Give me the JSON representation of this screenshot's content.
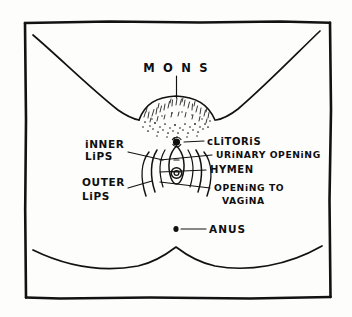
{
  "diagram": {
    "style": "hand-drawn ink line illustration",
    "background_color": "#fdfdfc",
    "ink_color": "#121212",
    "frame": {
      "name": "hand-drawn rectangular border",
      "shown": true
    },
    "labels": {
      "mons": "M O N S",
      "inner_lips_line1": "iNNER",
      "inner_lips_line2": "LiPS",
      "outer_lips_line1": "OUTER",
      "outer_lips_line2": "LiPS",
      "clitoris": "cLiTORiS",
      "urinary_opening": "URiNARY OPENiNG",
      "hymen": "HYMEN",
      "opening_to_vagina_line1": "OPENiNG TO",
      "opening_to_vagina_line2": "VAGiNA",
      "anus": "ANUS"
    },
    "parts": [
      {
        "id": "mons",
        "label": "M O N S",
        "side": "top",
        "leader": "vertical"
      },
      {
        "id": "inner-lips",
        "label": "iNNER LiPS",
        "side": "left",
        "leader": "diagonal"
      },
      {
        "id": "outer-lips",
        "label": "OUTER LiPS",
        "side": "left",
        "leader": "diagonal"
      },
      {
        "id": "clitoris",
        "label": "cLiTORiS",
        "side": "right",
        "leader": "horizontal"
      },
      {
        "id": "urinary-opening",
        "label": "URiNARY OPENiNG",
        "side": "right",
        "leader": "diagonal"
      },
      {
        "id": "hymen",
        "label": "HYMEN",
        "side": "right",
        "leader": "horizontal"
      },
      {
        "id": "opening-to-vagina",
        "label": "OPENiNG TO VAGiNA",
        "side": "right",
        "leader": "diagonal"
      },
      {
        "id": "anus",
        "label": "ANUS",
        "side": "right",
        "leader": "horizontal"
      }
    ]
  }
}
